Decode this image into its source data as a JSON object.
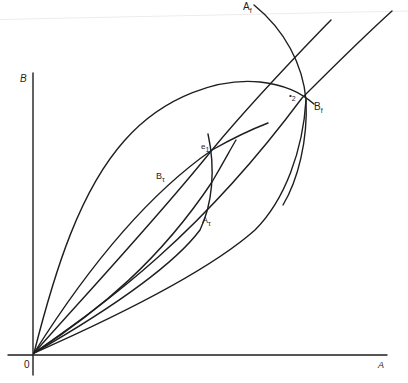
{
  "figure": {
    "type": "economic-diagram",
    "stroke_color": "#1e1e1e",
    "background": "#ffffff"
  },
  "axes": {
    "origin_label": "0",
    "x_label": "A",
    "y_label": "B"
  },
  "labels": {
    "A_f": {
      "base": "A",
      "sub": "f"
    },
    "B_f": {
      "base": "B",
      "sub": "f"
    },
    "A_t": {
      "base": "A",
      "sub": "τ"
    },
    "B_t": {
      "base": "B",
      "sub": "τ"
    },
    "e1": {
      "base": "e",
      "sub": "1"
    },
    "e2": {
      "base": "•",
      "sub": "2"
    }
  },
  "curves": [
    {
      "id": "outer-offer-curve-upper",
      "desc": "large lens upper boundary from origin looping to Bf"
    },
    {
      "id": "outer-offer-curve-lower",
      "desc": "large lens lower boundary from origin to Bf"
    },
    {
      "id": "ray-1",
      "desc": "steep trade ray through e1"
    },
    {
      "id": "ray-2",
      "desc": "trade ray through e2"
    },
    {
      "id": "curve-Bt",
      "desc": "Bτ offer curve through e1"
    },
    {
      "id": "curve-At",
      "desc": "Aτ offer curve through e1"
    },
    {
      "id": "curve-Af",
      "desc": "Af arc through e2"
    }
  ]
}
